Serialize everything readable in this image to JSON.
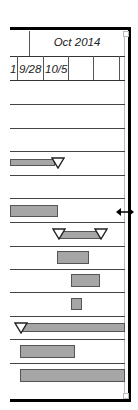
{
  "timeline": {
    "month_label": "Oct 2014",
    "days": [
      "1",
      "9/28",
      "10/5",
      "",
      ""
    ]
  },
  "colors": {
    "bar_fill": "#a6a6a6",
    "bar_border": "#555555",
    "grid": "#444444",
    "frame": "#000000"
  },
  "rows": [
    {
      "type": "empty"
    },
    {
      "type": "empty"
    },
    {
      "type": "empty"
    },
    {
      "type": "bar_with_milestone_end",
      "bar_x": 10,
      "bar_w": 43,
      "milestone_x": 57
    },
    {
      "type": "empty"
    },
    {
      "type": "bar",
      "bar_x": 10,
      "bar_w": 48
    },
    {
      "type": "summary",
      "bar_x": 60,
      "bar_w": 42,
      "milestone_start": 58,
      "milestone_end": 101
    },
    {
      "type": "bar",
      "bar_x": 57,
      "bar_w": 32
    },
    {
      "type": "bar",
      "bar_x": 71,
      "bar_w": 29
    },
    {
      "type": "bar",
      "bar_x": 71,
      "bar_w": 11
    },
    {
      "type": "milestone_with_bar",
      "milestone_x": 20,
      "bar_x": 22,
      "bar_w": 103
    },
    {
      "type": "bar",
      "bar_x": 20,
      "bar_w": 55
    },
    {
      "type": "bar",
      "bar_x": 20,
      "bar_w": 105
    }
  ],
  "cursor": {
    "icon": "resize-horizontal-icon"
  }
}
